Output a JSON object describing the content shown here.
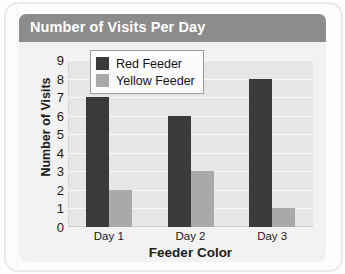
{
  "chart_data": {
    "type": "bar",
    "title": "Number of Visits Per Day",
    "xlabel": "Feeder Color",
    "ylabel": "Number of Visits",
    "categories": [
      "Day 1",
      "Day 2",
      "Day 3"
    ],
    "series": [
      {
        "name": "Red Feeder",
        "values": [
          7,
          6,
          8
        ],
        "color": "#3a3a3a"
      },
      {
        "name": "Yellow Feeder",
        "values": [
          2,
          3,
          1
        ],
        "color": "#a9a9a9"
      }
    ],
    "ylim": [
      0,
      9
    ],
    "yticks": [
      0,
      1,
      2,
      3,
      4,
      5,
      6,
      7,
      8,
      9
    ],
    "grid": true,
    "legend_position": "top-center",
    "plot_background": "#e6e6e6",
    "gridline_color": "#f7f7f7"
  },
  "figure": {
    "title_band_color": "#8c8c8c",
    "title_text_color": "#ffffff",
    "card_background": "#f2f2f2"
  }
}
